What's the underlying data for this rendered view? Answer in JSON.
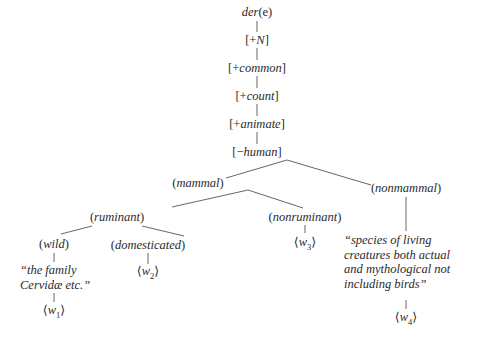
{
  "tree": {
    "root": {
      "open": "",
      "label": "der",
      "suffix": "(e)"
    },
    "features": [
      {
        "sign": "+",
        "label": "N"
      },
      {
        "sign": "+",
        "label": "common"
      },
      {
        "sign": "+",
        "label": "count"
      },
      {
        "sign": "+",
        "label": "animate"
      },
      {
        "sign": "−",
        "label": "human"
      }
    ],
    "nodes": {
      "mammal": "mammal",
      "nonmammal": "nonmammal",
      "ruminant": "ruminant",
      "nonruminant": "nonruminant",
      "wild": "wild",
      "domesticated": "domesticated"
    },
    "glosses": {
      "wild": "“the family\nCervidæ etc.”",
      "nonmammal": "“species of living\ncreatures both actual\nand mythological not\nincluding birds”"
    },
    "leaves": {
      "w1": {
        "base": "w",
        "sub": "1"
      },
      "w2": {
        "base": "w",
        "sub": "2"
      },
      "w3": {
        "base": "w",
        "sub": "3"
      },
      "w4": {
        "base": "w",
        "sub": "4"
      }
    }
  }
}
